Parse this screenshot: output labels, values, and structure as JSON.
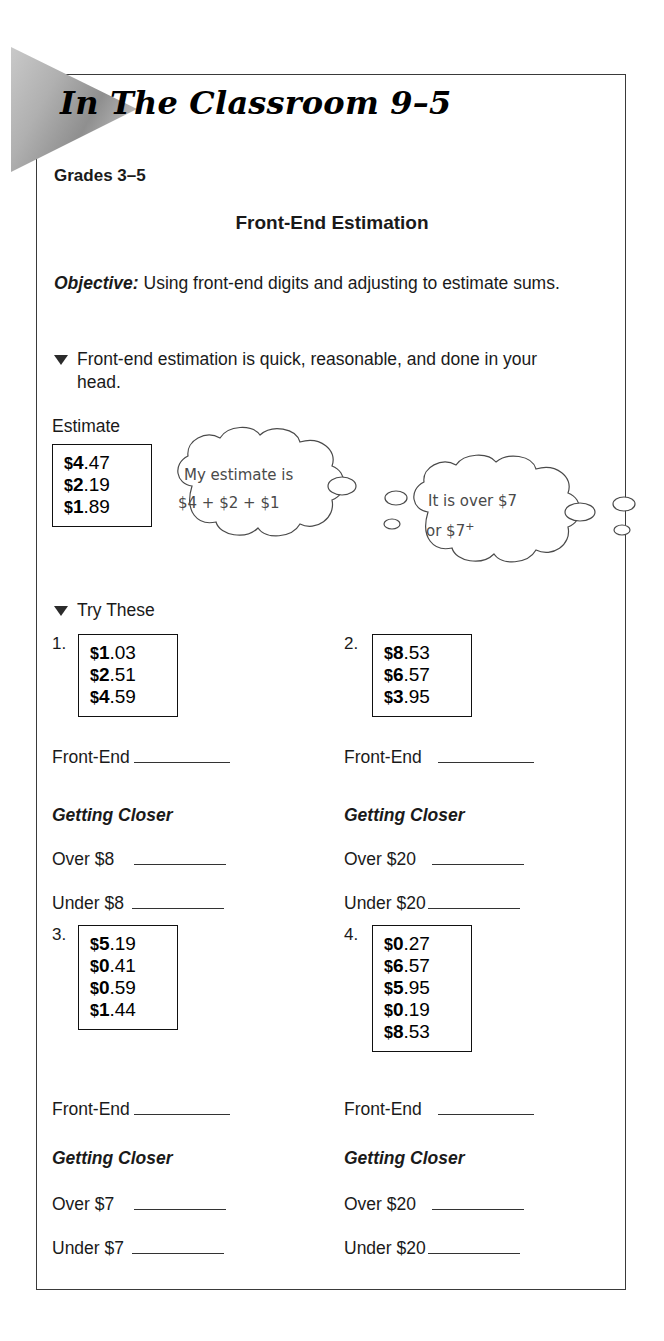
{
  "header": {
    "title": "In The Classroom 9–5",
    "grades": "Grades 3–5",
    "worksheet_title": "Front-End Estimation"
  },
  "objective": {
    "label": "Objective:",
    "text": " Using front-end digits and adjusting to estimate sums."
  },
  "bullet_note": {
    "text": "Front-end estimation is quick, reasonable, and done in your head."
  },
  "example": {
    "estimate_label": "Estimate",
    "values": [
      {
        "dollar": "$",
        "lead": "4",
        "cents": ".47"
      },
      {
        "dollar": "$",
        "lead": "2",
        "cents": ".19"
      },
      {
        "dollar": "$",
        "lead": "1",
        "cents": ".89"
      }
    ],
    "bubble_1": {
      "line1": "My estimate is",
      "line2": "$4 + $2 + $1"
    },
    "bubble_2": {
      "line1": "It is over $7",
      "line2": "or $7",
      "line2_sup": "+"
    }
  },
  "try_these": {
    "label": "Try These"
  },
  "problems": [
    {
      "number": "1.",
      "values": [
        {
          "dollar": "$",
          "lead": "1",
          "cents": ".03"
        },
        {
          "dollar": "$",
          "lead": "2",
          "cents": ".51"
        },
        {
          "dollar": "$",
          "lead": "4",
          "cents": ".59"
        }
      ],
      "front_end_label": "Front-End",
      "getting_closer_label": "Getting Closer",
      "over_label": "Over $8",
      "under_label": "Under $8"
    },
    {
      "number": "2.",
      "values": [
        {
          "dollar": "$",
          "lead": "8",
          "cents": ".53"
        },
        {
          "dollar": "$",
          "lead": "6",
          "cents": ".57"
        },
        {
          "dollar": "$",
          "lead": "3",
          "cents": ".95"
        }
      ],
      "front_end_label": "Front-End",
      "getting_closer_label": "Getting Closer",
      "over_label": "Over $20",
      "under_label": "Under $20"
    },
    {
      "number": "3.",
      "values": [
        {
          "dollar": "$",
          "lead": "5",
          "cents": ".19"
        },
        {
          "dollar": "$",
          "lead": "0",
          "cents": ".41"
        },
        {
          "dollar": "$",
          "lead": "0",
          "cents": ".59"
        },
        {
          "dollar": "$",
          "lead": "1",
          "cents": ".44"
        }
      ],
      "front_end_label": "Front-End",
      "getting_closer_label": "Getting Closer",
      "over_label": "Over $7",
      "under_label": "Under $7"
    },
    {
      "number": "4.",
      "values": [
        {
          "dollar": "$",
          "lead": "0",
          "cents": ".27"
        },
        {
          "dollar": "$",
          "lead": "6",
          "cents": ".57"
        },
        {
          "dollar": "$",
          "lead": "5",
          "cents": ".95"
        },
        {
          "dollar": "$",
          "lead": "0",
          "cents": ".19"
        },
        {
          "dollar": "$",
          "lead": "8",
          "cents": ".53"
        }
      ],
      "front_end_label": "Front-End",
      "getting_closer_label": "Getting Closer",
      "over_label": "Over $20",
      "under_label": "Under $20"
    }
  ],
  "colors": {
    "ink": "#1a1a1a",
    "rule": "#333333",
    "frame": "#3a3a3a",
    "pennant_light": "#d8d8d8",
    "pennant_dark": "#8a8a8a"
  }
}
